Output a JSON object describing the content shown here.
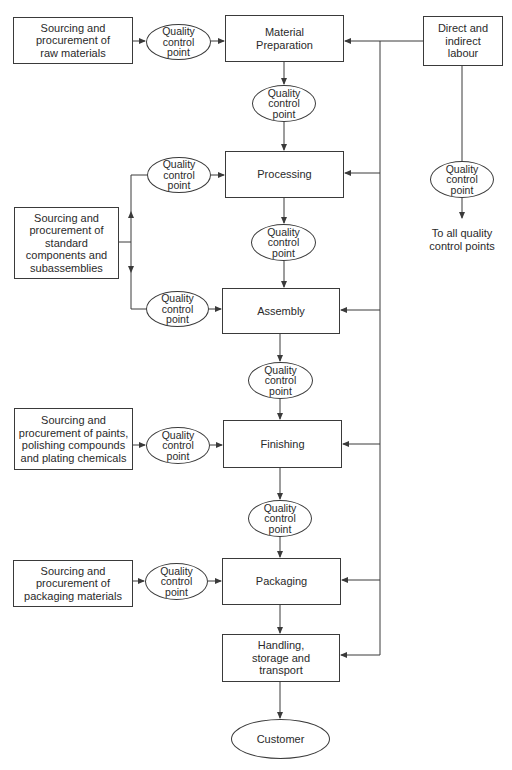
{
  "diagram": {
    "type": "flowchart",
    "main_flow": [
      {
        "id": "material_preparation",
        "label": "Material\nPreparation"
      },
      {
        "id": "processing",
        "label": "Processing"
      },
      {
        "id": "assembly",
        "label": "Assembly"
      },
      {
        "id": "finishing",
        "label": "Finishing"
      },
      {
        "id": "packaging",
        "label": "Packaging"
      },
      {
        "id": "handling",
        "label": "Handling,\nstorage and\ntransport"
      },
      {
        "id": "customer",
        "label": "Customer"
      }
    ],
    "sources": {
      "raw_materials": "Sourcing and\nprocurement of\nraw materials",
      "standard_components": "Sourcing and\nprocurement of\nstandard\ncomponents and\nsubassemblies",
      "paints": "Sourcing and\nprocurement of paints,\npolishing compounds\nand plating chemicals",
      "packaging_materials": "Sourcing and\nprocurement of\npackaging materials"
    },
    "labour": {
      "label": "Direct and\nindirect\nlabour",
      "target_text": "To all quality\ncontrol points"
    },
    "qcp_label": "Quality\ncontrol\npoint",
    "colors": {
      "line": "#3a3a3a",
      "text": "#2a2a2a",
      "background": "#ffffff"
    }
  }
}
